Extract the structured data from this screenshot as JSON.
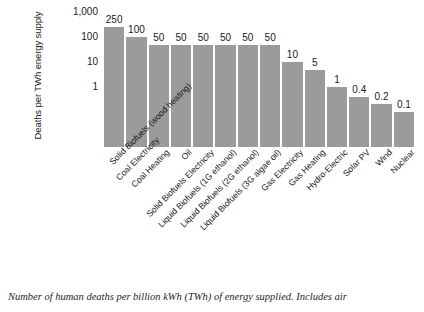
{
  "chart_data": {
    "type": "bar",
    "title": "",
    "xlabel": "",
    "ylabel": "Deaths per TWh energy supply",
    "yscale": "log",
    "ylim": [
      0.04,
      1000
    ],
    "grid": false,
    "legend": null,
    "categories": [
      "Solid Biofuels (wood heating)",
      "Coal Electricity",
      "Coal Heating",
      "Oil",
      "Solid Biofuels Electricity",
      "Liquid Biofuels (1G ethanol)",
      "Liquid Biofuels (2G ethanol)",
      "Liquid Biofuels (3G algae oil)",
      "Gas Electricity",
      "Gas Heating",
      "Hydro-Electric",
      "Solar PV",
      "Wind",
      "Nuclear"
    ],
    "values": [
      250,
      100,
      50,
      50,
      50,
      50,
      50,
      50,
      10,
      5,
      1,
      0.4,
      0.2,
      0.1
    ],
    "value_labels": [
      "250",
      "100",
      "50",
      "50",
      "50",
      "50",
      "50",
      "50",
      "10",
      "5",
      "1",
      "0.4",
      "0.2",
      "0.1"
    ],
    "ytick_labels": [
      "1,000",
      "100",
      "10",
      "1"
    ],
    "ytick_values": [
      1000,
      100,
      10,
      1
    ],
    "bar_color": "#9b9b9b",
    "background_color": "#ffffff"
  },
  "caption": {
    "text": "Number of human deaths per billion kWh (TWh) of energy supplied. Includes air"
  }
}
